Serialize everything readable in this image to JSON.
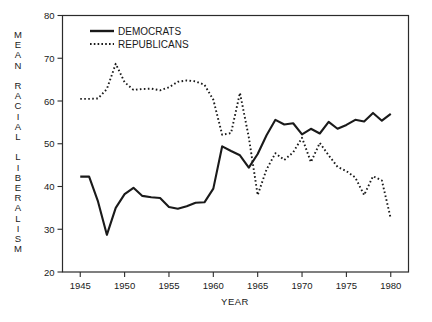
{
  "chart_data": {
    "type": "line",
    "title": "",
    "xlabel": "YEAR",
    "ylabel": "MEAN RACIAL LIBERALISM",
    "xlim": [
      1943,
      1982
    ],
    "ylim": [
      20,
      80
    ],
    "xticks": [
      1945,
      1950,
      1955,
      1960,
      1965,
      1970,
      1975,
      1980
    ],
    "yticks": [
      20,
      30,
      40,
      50,
      60,
      70,
      80
    ],
    "grid": false,
    "legend_position": "top-left",
    "series": [
      {
        "name": "DEMOCRATS",
        "style": "solid",
        "color": "#1a1a1a",
        "x": [
          1945,
          1946,
          1947,
          1948,
          1949,
          1950,
          1951,
          1952,
          1953,
          1954,
          1955,
          1956,
          1957,
          1958,
          1959,
          1960,
          1961,
          1962,
          1963,
          1964,
          1965,
          1966,
          1967,
          1968,
          1969,
          1970,
          1971,
          1972,
          1973,
          1974,
          1975,
          1976,
          1977,
          1978,
          1979,
          1980
        ],
        "y": [
          42.3,
          42.3,
          36.5,
          28.7,
          35.0,
          38.2,
          39.7,
          37.8,
          37.5,
          37.3,
          35.2,
          34.8,
          35.4,
          36.2,
          36.3,
          39.5,
          49.4,
          48.3,
          47.3,
          44.4,
          47.6,
          52.0,
          55.6,
          54.5,
          54.8,
          52.2,
          53.5,
          52.4,
          55.1,
          53.5,
          54.4,
          55.6,
          55.2,
          57.2,
          55.4,
          57.0
        ]
      },
      {
        "name": "REPUBLICANS",
        "style": "dotted",
        "color": "#1a1a1a",
        "x": [
          1945,
          1946,
          1947,
          1948,
          1949,
          1950,
          1951,
          1952,
          1953,
          1954,
          1955,
          1956,
          1957,
          1958,
          1959,
          1960,
          1961,
          1962,
          1963,
          1964,
          1965,
          1966,
          1967,
          1968,
          1969,
          1970,
          1971,
          1972,
          1973,
          1974,
          1975,
          1976,
          1977,
          1978,
          1979,
          1980
        ],
        "y": [
          60.5,
          60.5,
          60.6,
          62.8,
          68.7,
          64.4,
          62.6,
          62.8,
          62.9,
          62.5,
          63.2,
          64.5,
          64.8,
          64.6,
          63.8,
          60.3,
          52.1,
          52.5,
          61.9,
          51.5,
          38.0,
          44.0,
          47.8,
          46.2,
          48.0,
          51.4,
          45.7,
          50.2,
          47.3,
          44.6,
          43.6,
          42.1,
          38.0,
          42.4,
          41.4,
          32.5
        ]
      }
    ],
    "legend": [
      {
        "label": "DEMOCRATS",
        "style": "solid"
      },
      {
        "label": "REPUBLICANS",
        "style": "dotted"
      }
    ]
  },
  "axes": {
    "x_tick_labels": [
      "1945",
      "1950",
      "1955",
      "1960",
      "1965",
      "1970",
      "1975",
      "1980"
    ],
    "y_tick_labels": [
      "80",
      "70",
      "60",
      "50",
      "40",
      "30",
      "20"
    ],
    "x_axis_title": "YEAR",
    "y_axis_title_chars": [
      "M",
      "E",
      "A",
      "N",
      "",
      "R",
      "A",
      "C",
      "I",
      "A",
      "L",
      "",
      "L",
      "I",
      "B",
      "E",
      "R",
      "A",
      "L",
      "I",
      "S",
      "M"
    ]
  },
  "legend": {
    "democrats_label": "DEMOCRATS",
    "republicans_label": "REPUBLICANS"
  },
  "colors": {
    "line": "#1a1a1a",
    "frame": "#2b2b2b",
    "background": "#ffffff"
  }
}
